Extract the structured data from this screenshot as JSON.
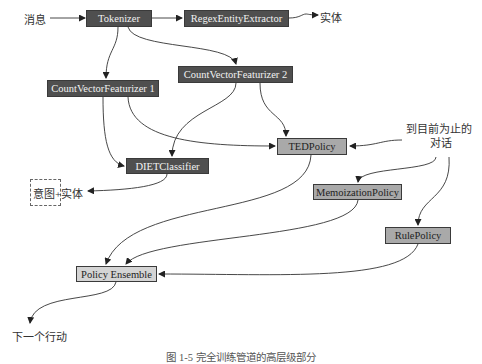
{
  "diagram": {
    "inputs": {
      "message": "消息",
      "conversation_so_far_line1": "到目前为止的",
      "conversation_so_far_line2": "对话"
    },
    "outputs": {
      "entities": "实体",
      "intent_entities": "意图+实体",
      "next_action": "下一个行动"
    },
    "nodes": {
      "tokenizer": "Tokenizer",
      "regex_entity_extractor": "RegexEntityExtractor",
      "count_vector_featurizer_1": "CountVectorFeaturizer 1",
      "count_vector_featurizer_2": "CountVectorFeaturizer 2",
      "diet_classifier": "DIETClassifier",
      "ted_policy": "TEDPolicy",
      "memoization_policy": "MemoizationPolicy",
      "rule_policy": "RulePolicy",
      "policy_ensemble": "Policy Ensemble"
    },
    "edges": [
      [
        "消息",
        "Tokenizer"
      ],
      [
        "Tokenizer",
        "RegexEntityExtractor"
      ],
      [
        "RegexEntityExtractor",
        "实体"
      ],
      [
        "Tokenizer",
        "CountVectorFeaturizer 1"
      ],
      [
        "Tokenizer",
        "CountVectorFeaturizer 2"
      ],
      [
        "CountVectorFeaturizer 1",
        "DIETClassifier"
      ],
      [
        "CountVectorFeaturizer 1",
        "TEDPolicy"
      ],
      [
        "CountVectorFeaturizer 2",
        "DIETClassifier"
      ],
      [
        "CountVectorFeaturizer 2",
        "TEDPolicy"
      ],
      [
        "DIETClassifier",
        "意图+实体"
      ],
      [
        "到目前为止的对话",
        "TEDPolicy"
      ],
      [
        "到目前为止的对话",
        "MemoizationPolicy"
      ],
      [
        "到目前为止的对话",
        "RulePolicy"
      ],
      [
        "TEDPolicy",
        "Policy Ensemble"
      ],
      [
        "MemoizationPolicy",
        "Policy Ensemble"
      ],
      [
        "RulePolicy",
        "Policy Ensemble"
      ],
      [
        "Policy Ensemble",
        "下一个行动"
      ]
    ],
    "colors": {
      "component_dark": "#4f4f4f",
      "policy_mid": "#a9a9a9",
      "ensemble_light": "#d4d4d4",
      "edge": "#333333"
    },
    "caption": "图 1-5  完全训练管道的高层级部分"
  }
}
